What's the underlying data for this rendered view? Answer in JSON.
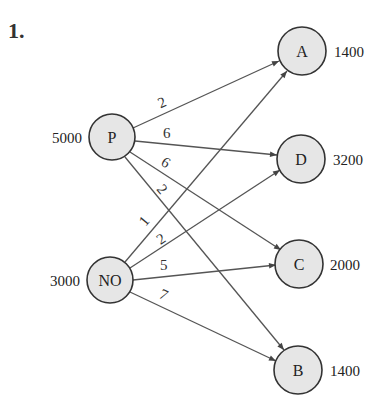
{
  "problem_number": "1.",
  "nodes": {
    "P": {
      "label": "P",
      "value": "5000"
    },
    "NO": {
      "label": "NO",
      "value": "3000"
    },
    "A": {
      "label": "A",
      "value": "1400"
    },
    "D": {
      "label": "D",
      "value": "3200"
    },
    "C": {
      "label": "C",
      "value": "2000"
    },
    "B": {
      "label": "B",
      "value": "1400"
    }
  },
  "edges": [
    {
      "from": "P",
      "to": "A",
      "cost": "2"
    },
    {
      "from": "P",
      "to": "D",
      "cost": "6"
    },
    {
      "from": "P",
      "to": "C",
      "cost": "6"
    },
    {
      "from": "P",
      "to": "B",
      "cost": "2"
    },
    {
      "from": "NO",
      "to": "A",
      "cost": "1"
    },
    {
      "from": "NO",
      "to": "D",
      "cost": "2"
    },
    {
      "from": "NO",
      "to": "C",
      "cost": "5"
    },
    {
      "from": "NO",
      "to": "B",
      "cost": "7"
    }
  ],
  "colors": {
    "node_fill": "#e6e6e6",
    "node_stroke": "#333333",
    "edge": "#555555"
  }
}
